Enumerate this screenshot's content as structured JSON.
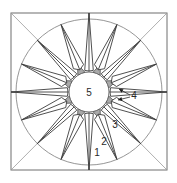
{
  "diagram": {
    "type": "mariners-compass-quilt-block",
    "canvas": {
      "width": 177,
      "height": 183
    },
    "center": {
      "x": 89,
      "y": 92
    },
    "frame": {
      "x": 11,
      "y": 13,
      "width": 156,
      "height": 157
    },
    "outer_circle_radius": 73,
    "hub_radius": 20,
    "star": {
      "main_points": 8,
      "secondary_points": 8,
      "base_radius": 22,
      "main_half_angle_deg": 11.25,
      "secondary_half_angle_deg": 11.25
    },
    "gray_triangle_radius": 25,
    "colors": {
      "line": "#3c3c3c",
      "frame": "#6e6e6e",
      "fill_gray": "#a9a9a9",
      "background": "#ffffff"
    },
    "labels": [
      {
        "id": "hub",
        "text": "5",
        "x": 89,
        "y": 96
      },
      {
        "id": "arrow-label",
        "text": "4",
        "x": 134,
        "y": 99
      },
      {
        "id": "piece-3",
        "text": "3",
        "x": 115,
        "y": 128
      },
      {
        "id": "piece-2",
        "text": "2",
        "x": 104,
        "y": 145
      },
      {
        "id": "piece-1",
        "text": "1",
        "x": 97,
        "y": 156
      }
    ],
    "arrows": [
      {
        "from": [
          130,
          95
        ],
        "to": [
          119,
          89
        ]
      },
      {
        "from": [
          130,
          97
        ],
        "to": [
          118,
          100
        ]
      }
    ]
  }
}
